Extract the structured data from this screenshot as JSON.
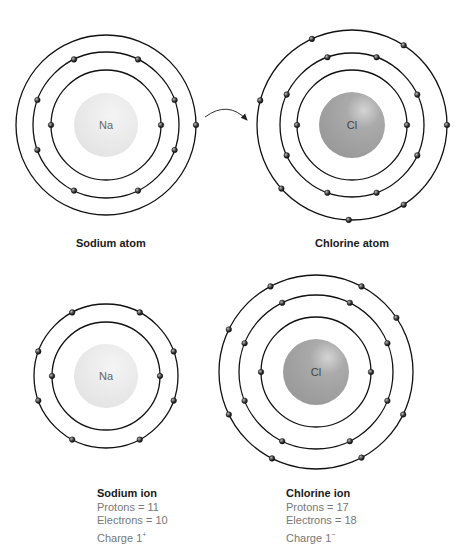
{
  "figure": {
    "arrow": "electron-transfer-arrow",
    "atoms": [
      {
        "id": "sodium-atom",
        "symbol": "Na",
        "label": "Sodium atom",
        "cx": 106,
        "cy": 125,
        "nucleus_r": 32,
        "nucleus_color": "#e8e8e8",
        "shells": [
          {
            "r": 55,
            "electron_angles": [
              0,
              180
            ]
          },
          {
            "r": 73,
            "electron_angles": [
              -64,
              -20,
              20,
              64,
              116,
              160,
              200,
              244
            ]
          },
          {
            "r": 90,
            "electron_angles": [
              0
            ]
          }
        ]
      },
      {
        "id": "chlorine-atom",
        "symbol": "Cl",
        "label": "Chlorine atom",
        "cx": 352,
        "cy": 125,
        "nucleus_r": 33,
        "nucleus_color": "#a8a8a8",
        "shells": [
          {
            "r": 55,
            "electron_angles": [
              0,
              180
            ]
          },
          {
            "r": 72,
            "electron_angles": [
              -70,
              -25,
              25,
              70,
              110,
              155,
              205,
              250
            ]
          },
          {
            "r": 95,
            "electron_angles": [
              -57,
              0,
              57,
              92,
              138,
              195,
              245
            ]
          }
        ]
      },
      {
        "id": "sodium-ion",
        "symbol": "Na",
        "cx": 106,
        "cy": 376,
        "nucleus_r": 32,
        "nucleus_color": "#e8e8e8",
        "shells": [
          {
            "r": 54,
            "electron_angles": [
              0,
              180
            ]
          },
          {
            "r": 72,
            "electron_angles": [
              -62,
              -20,
              20,
              62,
              118,
              160,
              200,
              242
            ]
          }
        ]
      },
      {
        "id": "chlorine-ion",
        "symbol": "Cl",
        "cx": 316,
        "cy": 372,
        "nucleus_r": 33,
        "nucleus_color": "#a8a8a8",
        "shells": [
          {
            "r": 55,
            "electron_angles": [
              0,
              180
            ]
          },
          {
            "r": 77,
            "electron_angles": [
              -64,
              -22,
              22,
              64,
              116,
              158,
              202,
              244
            ]
          },
          {
            "r": 97,
            "electron_angles": [
              -62,
              -34,
              26,
              62,
              117,
              154,
              206,
              242
            ]
          }
        ]
      }
    ],
    "ion_info": [
      {
        "title": "Sodium ion",
        "protons": "Protons = 11",
        "electrons": "Electrons = 10",
        "charge": "Charge 1",
        "charge_sign": "+"
      },
      {
        "title": "Chlorine ion",
        "protons": "Protons = 17",
        "electrons": "Electrons = 18",
        "charge": "Charge 1",
        "charge_sign": "−"
      }
    ]
  }
}
